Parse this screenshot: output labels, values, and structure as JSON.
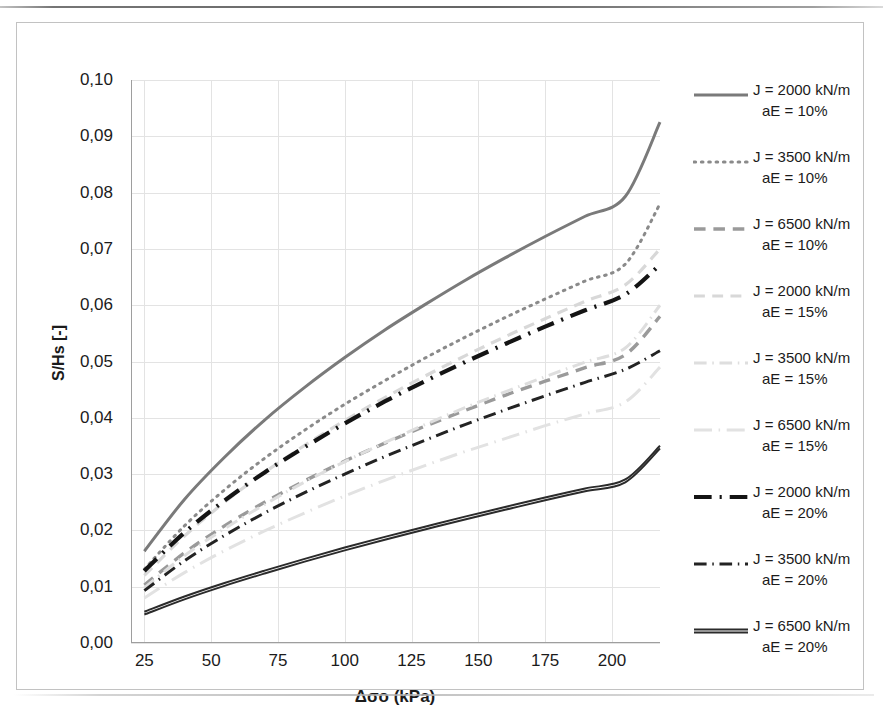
{
  "figure": {
    "y_axis_title": "S/Hs [-]",
    "x_axis_title": "Δσo (kPa)",
    "y_tick_labels": [
      "0,10",
      "0,09",
      "0,08",
      "0,07",
      "0,06",
      "0,05",
      "0,04",
      "0,03",
      "0,02",
      "0,01",
      "0,00"
    ],
    "x_tick_labels": [
      "25",
      "50",
      "75",
      "100",
      "125",
      "150",
      "175",
      "200"
    ]
  },
  "legend": {
    "items": [
      {
        "line1": "J = 2000 kN/m",
        "line2": "aE = 10%",
        "style": "solid",
        "color": "#7a7a7a",
        "width": 3.0
      },
      {
        "line1": "J = 3500 kN/m",
        "line2": "aE = 10%",
        "style": "dotted",
        "color": "#8a8a8a",
        "width": 3.0
      },
      {
        "line1": "J = 6500 kN/m",
        "line2": "aE = 10%",
        "style": "dashed",
        "color": "#9a9a9a",
        "width": 3.4
      },
      {
        "line1": "J = 2000 kN/m",
        "line2": "aE = 15%",
        "style": "dashed",
        "color": "#d8d8d8",
        "width": 3.2
      },
      {
        "line1": "J = 3500 kN/m",
        "line2": "aE = 15%",
        "style": "dash-dot",
        "color": "#dedede",
        "width": 3.0
      },
      {
        "line1": "J = 6500 kN/m",
        "line2": "aE = 15%",
        "style": "long-dash-dot",
        "color": "#e2e2e2",
        "width": 3.0
      },
      {
        "line1": "J = 2000 kN/m",
        "line2": "aE = 20%",
        "style": "dash-dot",
        "color": "#141414",
        "width": 4.2
      },
      {
        "line1": "J = 3500 kN/m",
        "line2": "aE = 20%",
        "style": "dash-dot",
        "color": "#232323",
        "width": 3.0
      },
      {
        "line1": "J = 6500 kN/m",
        "line2": "aE = 20%",
        "style": "double-solid",
        "color": "#2b2b2b",
        "width": 2.0
      }
    ]
  },
  "chart_data": {
    "type": "line",
    "title": "",
    "xlabel": "Δσo (kPa)",
    "ylabel": "S/Hs [-]",
    "xlim": [
      20,
      218
    ],
    "ylim": [
      0.0,
      0.1
    ],
    "xticks": [
      25,
      50,
      75,
      100,
      125,
      150,
      175,
      200
    ],
    "yticks": [
      0.0,
      0.01,
      0.02,
      0.03,
      0.04,
      0.05,
      0.06,
      0.07,
      0.08,
      0.09,
      0.1
    ],
    "grid": true,
    "legend_position": "right",
    "x": [
      25,
      40,
      55,
      70,
      85,
      100,
      115,
      130,
      145,
      160,
      175,
      190,
      205,
      218
    ],
    "series": [
      {
        "name": "J = 2000 kN/m, aE = 10%",
        "J": 2000,
        "aE": "10%",
        "style": "solid",
        "color": "#7a7a7a",
        "width": 3.0,
        "values": [
          0.0163,
          0.0255,
          0.033,
          0.0396,
          0.0454,
          0.0507,
          0.0556,
          0.0601,
          0.0644,
          0.0684,
          0.0722,
          0.0758,
          0.0793,
          0.0925
        ]
      },
      {
        "name": "J = 3500 kN/m, aE = 10%",
        "J": 3500,
        "aE": "10%",
        "style": "dotted",
        "color": "#8a8a8a",
        "width": 3.0,
        "values": [
          0.0131,
          0.0208,
          0.0272,
          0.0328,
          0.0378,
          0.0424,
          0.0466,
          0.0506,
          0.0543,
          0.0578,
          0.0611,
          0.0643,
          0.0673,
          0.078
        ]
      },
      {
        "name": "J = 6500 kN/m, aE = 10%",
        "J": 6500,
        "aE": "10%",
        "style": "dashed",
        "color": "#9a9a9a",
        "width": 3.4,
        "values": [
          0.0103,
          0.016,
          0.0208,
          0.025,
          0.0288,
          0.0323,
          0.0355,
          0.0385,
          0.0413,
          0.044,
          0.0465,
          0.0489,
          0.0512,
          0.058
        ]
      },
      {
        "name": "J = 2000 kN/m, aE = 15%",
        "J": 2000,
        "aE": "15%",
        "style": "dashed",
        "color": "#d8d8d8",
        "width": 3.2,
        "values": [
          0.012,
          0.019,
          0.025,
          0.0303,
          0.0351,
          0.0395,
          0.0436,
          0.0474,
          0.051,
          0.0544,
          0.0576,
          0.0607,
          0.0636,
          0.07
        ]
      },
      {
        "name": "J = 3500 kN/m, aE = 15%",
        "J": 3500,
        "aE": "15%",
        "style": "dash-dot",
        "color": "#dedede",
        "width": 3.0,
        "values": [
          0.0098,
          0.0155,
          0.0203,
          0.0246,
          0.0286,
          0.0322,
          0.0356,
          0.0388,
          0.0418,
          0.0446,
          0.0473,
          0.0499,
          0.0524,
          0.06
        ]
      },
      {
        "name": "J = 6500 kN/m, aE = 15%",
        "J": 6500,
        "aE": "15%",
        "style": "long-dash-dot",
        "color": "#e2e2e2",
        "width": 3.0,
        "values": [
          0.008,
          0.0125,
          0.0164,
          0.0199,
          0.0231,
          0.0261,
          0.0289,
          0.0315,
          0.034,
          0.0363,
          0.0386,
          0.0407,
          0.0428,
          0.049
        ]
      },
      {
        "name": "J = 2000 kN/m, aE = 20%",
        "J": 2000,
        "aE": "20%",
        "style": "dash-dot",
        "color": "#141414",
        "width": 4.2,
        "values": [
          0.0128,
          0.0196,
          0.0253,
          0.0303,
          0.0348,
          0.039,
          0.0429,
          0.0465,
          0.0499,
          0.0531,
          0.0562,
          0.0591,
          0.0619,
          0.0672
        ]
      },
      {
        "name": "J = 3500 kN/m, aE = 20%",
        "J": 3500,
        "aE": "20%",
        "style": "dash-dot",
        "color": "#232323",
        "width": 3.0,
        "values": [
          0.0093,
          0.0146,
          0.0191,
          0.0231,
          0.0267,
          0.03,
          0.0331,
          0.036,
          0.0388,
          0.0414,
          0.0439,
          0.0463,
          0.0486,
          0.0519
        ]
      },
      {
        "name": "J = 6500 kN/m, aE = 20%",
        "J": 6500,
        "aE": "20%",
        "style": "double-solid",
        "color": "#2b2b2b",
        "width": 2.0,
        "values": [
          0.0053,
          0.008,
          0.0104,
          0.0126,
          0.0147,
          0.0167,
          0.0186,
          0.0204,
          0.0222,
          0.0239,
          0.0256,
          0.0272,
          0.0288,
          0.0348
        ]
      }
    ]
  }
}
